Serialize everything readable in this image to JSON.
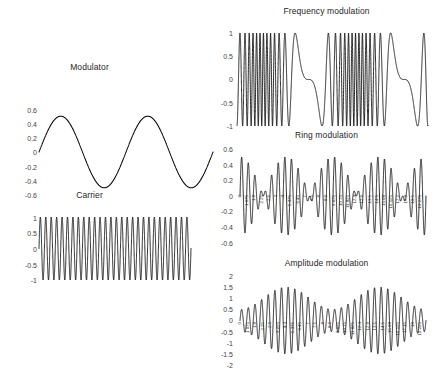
{
  "figure": {
    "background_color": "#ffffff",
    "line_color": "#000000",
    "text_color": "#262626"
  },
  "panels": {
    "modulator": {
      "title": "Modulator",
      "yticks": [
        "0.6",
        "0.4",
        "0.2",
        "0",
        "-0.2",
        "-0.4",
        "-0.6"
      ]
    },
    "carrier": {
      "title": "Carrier",
      "yticks": [
        "1",
        "0.5",
        "0",
        "-0.5",
        "-1"
      ]
    },
    "frequency_modulation": {
      "title": "Frequency modulation",
      "yticks": [
        "1",
        "0.5",
        "0",
        "-0.5",
        "-1"
      ]
    },
    "ring_modulation": {
      "title": "Ring modulation",
      "yticks": [
        "0.6",
        "0.4",
        "0.2",
        "0",
        "-0.2",
        "-0.4",
        "-0.6"
      ],
      "xticks": [
        "0",
        "1.075",
        "1.8",
        "2.25",
        "2.6",
        "3",
        "4",
        "5.375",
        "6.45",
        "7",
        "7.5",
        "8",
        "8.6",
        "9.675",
        "10.75",
        "11.825",
        "12.4",
        "12.9",
        "13.5",
        "14.5",
        "15.08",
        "16.125",
        "17.2",
        "17.8",
        "18.5",
        "19.275"
      ]
    },
    "amplitude_modulation": {
      "title": "Amplitude modulation",
      "yticks": [
        "2",
        "1.5",
        "1",
        "0.5",
        "0",
        "-0.5",
        "-1",
        "-1.5",
        "-2"
      ],
      "xticks": [
        "0",
        "1.075",
        "1.8",
        "2.25",
        "2.6",
        "3.225",
        "4.3",
        "5.375",
        "6.45",
        "7",
        "7.5",
        "8",
        "8.6",
        "9.675",
        "10.75",
        "11.825",
        "12.4",
        "12.9",
        "13.5",
        "14.5",
        "15.08",
        "16.125",
        "17.15",
        "18",
        "19.225"
      ]
    }
  },
  "chart_data": [
    {
      "type": "line",
      "name": "modulator",
      "title": "Modulator",
      "xlabel": "",
      "ylabel": "",
      "ylim": [
        -0.6,
        0.6
      ],
      "xlim": [
        0,
        20
      ],
      "grid": false,
      "legend": "none",
      "waveform": "sine",
      "amplitude": 0.5,
      "cycles": 2,
      "phase": 0,
      "ytick_values": [
        0.6,
        0.4,
        0.2,
        0,
        -0.2,
        -0.4,
        -0.6
      ]
    },
    {
      "type": "line",
      "name": "carrier",
      "title": "Carrier",
      "xlabel": "",
      "ylabel": "",
      "ylim": [
        -1,
        1
      ],
      "xlim": [
        0,
        20
      ],
      "grid": false,
      "legend": "none",
      "waveform": "sine",
      "amplitude": 1,
      "cycles": 28,
      "phase": 0,
      "ytick_values": [
        1,
        0.5,
        0,
        -0.5,
        -1
      ]
    },
    {
      "type": "line",
      "name": "frequency-modulation",
      "title": "Frequency modulation",
      "xlabel": "",
      "ylabel": "",
      "ylim": [
        -1,
        1
      ],
      "xlim": [
        0,
        20
      ],
      "grid": false,
      "legend": "none",
      "waveform": "fm",
      "amplitude": 1,
      "carrier_cycles": 28,
      "modulation_index": 14,
      "modulator_cycles": 2,
      "ytick_values": [
        1,
        0.5,
        0,
        -0.5,
        -1
      ]
    },
    {
      "type": "line",
      "name": "ring-modulation",
      "title": "Ring modulation",
      "xlabel": "",
      "ylabel": "",
      "ylim": [
        -0.6,
        0.6
      ],
      "xlim": [
        0,
        20
      ],
      "grid": false,
      "legend": "none",
      "waveform": "ring",
      "envelope_amplitude": 0.5,
      "carrier_cycles": 28,
      "modulator_cycles": 2,
      "ytick_values": [
        0.6,
        0.4,
        0.2,
        0,
        -0.2,
        -0.4,
        -0.6
      ]
    },
    {
      "type": "line",
      "name": "amplitude-modulation",
      "title": "Amplitude modulation",
      "xlabel": "",
      "ylabel": "",
      "ylim": [
        -2,
        2
      ],
      "xlim": [
        0,
        20
      ],
      "grid": false,
      "legend": "none",
      "waveform": "am",
      "dc_offset": 1,
      "modulation_depth": 0.5,
      "carrier_cycles": 28,
      "modulator_cycles": 2,
      "ytick_values": [
        2,
        1.5,
        1,
        0.5,
        0,
        -0.5,
        -1,
        -1.5,
        -2
      ]
    }
  ]
}
